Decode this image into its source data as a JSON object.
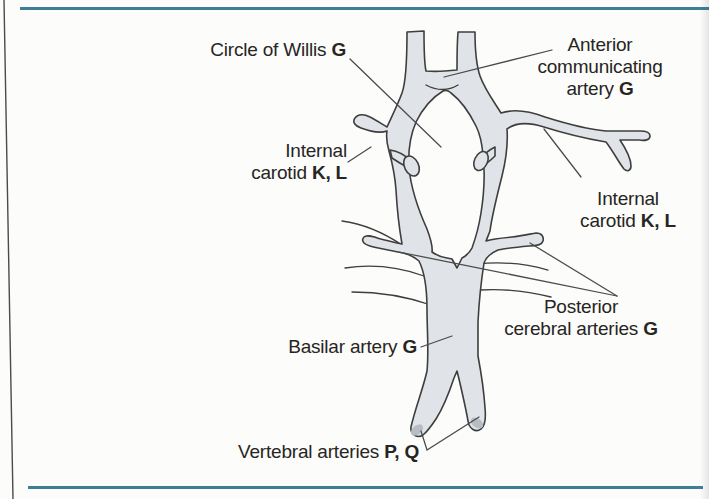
{
  "diagram": {
    "labels": {
      "circle_of_willis": {
        "text": "Circle of Willis",
        "code": "G"
      },
      "anterior_communicating": {
        "line1": "Anterior",
        "line2": "communicating",
        "line3": "artery",
        "code": "G"
      },
      "internal_carotid_left": {
        "line1": "Internal",
        "line2": "carotid",
        "code": "K, L"
      },
      "internal_carotid_right": {
        "line1": "Internal",
        "line2": "carotid",
        "code": "K, L"
      },
      "posterior_cerebral": {
        "line1": "Posterior",
        "line2": "cerebral arteries",
        "code": "G"
      },
      "basilar": {
        "text": "Basilar artery",
        "code": "G"
      },
      "vertebral": {
        "text": "Vertebral arteries",
        "code": "P, Q"
      }
    },
    "colors": {
      "vessel_fill": "#e0e4e9",
      "vessel_outline": "#3e3e3e",
      "tip_shade": "#b7bdc3",
      "rule": "#3e7e99",
      "leader": "#4a4a4a",
      "text": "#272523",
      "page_edge": "#4b4b4b"
    }
  }
}
